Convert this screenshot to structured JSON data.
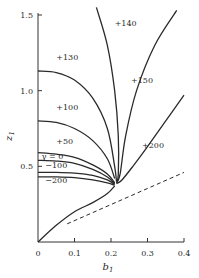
{
  "chart_data": {
    "type": "line",
    "title": "",
    "xlabel": "b1",
    "ylabel": "z1",
    "xlim": [
      0,
      0.4
    ],
    "ylim": [
      0,
      1.5
    ],
    "grid": false,
    "legend": "inline curve labels",
    "x_ticks": [
      "0",
      "0.1",
      "0.2",
      "0.3",
      "0.4"
    ],
    "y_ticks": [
      "0.5",
      "1.0",
      "1.5"
    ],
    "x_tick_values": [
      0,
      0.1,
      0.2,
      0.3,
      0.4
    ],
    "y_tick_values": [
      0.5,
      1.0,
      1.5
    ],
    "convergence_point": [
      0.21,
      0.38
    ],
    "series": [
      {
        "name": "+130",
        "label_pos": [
          0.05,
          1.2
        ],
        "points": [
          [
            0,
            1.13
          ],
          [
            0.05,
            1.12
          ],
          [
            0.1,
            1.07
          ],
          [
            0.15,
            0.95
          ],
          [
            0.19,
            0.75
          ],
          [
            0.21,
            0.5
          ],
          [
            0.215,
            0.4
          ]
        ]
      },
      {
        "name": "+100",
        "label_pos": [
          0.05,
          0.87
        ],
        "points": [
          [
            0,
            0.8
          ],
          [
            0.05,
            0.79
          ],
          [
            0.1,
            0.75
          ],
          [
            0.15,
            0.67
          ],
          [
            0.19,
            0.55
          ],
          [
            0.21,
            0.42
          ]
        ]
      },
      {
        "name": "+50",
        "label_pos": [
          0.05,
          0.65
        ],
        "points": [
          [
            0,
            0.59
          ],
          [
            0.05,
            0.58
          ],
          [
            0.1,
            0.56
          ],
          [
            0.15,
            0.51
          ],
          [
            0.19,
            0.45
          ],
          [
            0.21,
            0.39
          ]
        ]
      },
      {
        "name": "γ = 0",
        "label_pos": [
          0.01,
          0.55
        ],
        "points": [
          [
            0,
            0.54
          ],
          [
            0.05,
            0.535
          ],
          [
            0.1,
            0.52
          ],
          [
            0.15,
            0.48
          ],
          [
            0.19,
            0.43
          ],
          [
            0.21,
            0.385
          ]
        ]
      },
      {
        "name": "−100",
        "label_pos": [
          0.02,
          0.49
        ],
        "points": [
          [
            0,
            0.46
          ],
          [
            0.05,
            0.46
          ],
          [
            0.1,
            0.455
          ],
          [
            0.15,
            0.44
          ],
          [
            0.19,
            0.41
          ],
          [
            0.21,
            0.38
          ]
        ]
      },
      {
        "name": "−200",
        "label_pos": [
          0.02,
          0.39
        ],
        "points": [
          [
            0,
            0.43
          ],
          [
            0.05,
            0.43
          ],
          [
            0.1,
            0.425
          ],
          [
            0.15,
            0.41
          ],
          [
            0.19,
            0.39
          ],
          [
            0.21,
            0.375
          ]
        ]
      },
      {
        "name": "+140",
        "label_pos": [
          0.21,
          1.43
        ],
        "points": [
          [
            0.16,
            1.55
          ],
          [
            0.19,
            1.3
          ],
          [
            0.21,
            1.0
          ],
          [
            0.22,
            0.7
          ],
          [
            0.22,
            0.45
          ],
          [
            0.215,
            0.39
          ]
        ]
      },
      {
        "name": "+150",
        "label_pos": [
          0.255,
          1.05
        ],
        "points": [
          [
            0.38,
            1.53
          ],
          [
            0.32,
            1.3
          ],
          [
            0.27,
            1.0
          ],
          [
            0.24,
            0.7
          ],
          [
            0.225,
            0.45
          ],
          [
            0.215,
            0.39
          ]
        ]
      },
      {
        "name": "+200",
        "label_pos": [
          0.285,
          0.62
        ],
        "points": [
          [
            0.4,
            0.97
          ],
          [
            0.35,
            0.8
          ],
          [
            0.3,
            0.63
          ],
          [
            0.26,
            0.5
          ],
          [
            0.23,
            0.41
          ],
          [
            0.215,
            0.385
          ]
        ]
      },
      {
        "name": "lower branch",
        "label_pos": null,
        "points": [
          [
            0,
            0
          ],
          [
            0.05,
            0.11
          ],
          [
            0.1,
            0.2
          ],
          [
            0.15,
            0.26
          ],
          [
            0.19,
            0.32
          ],
          [
            0.21,
            0.37
          ]
        ]
      },
      {
        "name": "dashed asymptote",
        "style": "dashed",
        "label_pos": null,
        "points": [
          [
            0.08,
            0.12
          ],
          [
            0.4,
            0.46
          ]
        ]
      }
    ]
  }
}
